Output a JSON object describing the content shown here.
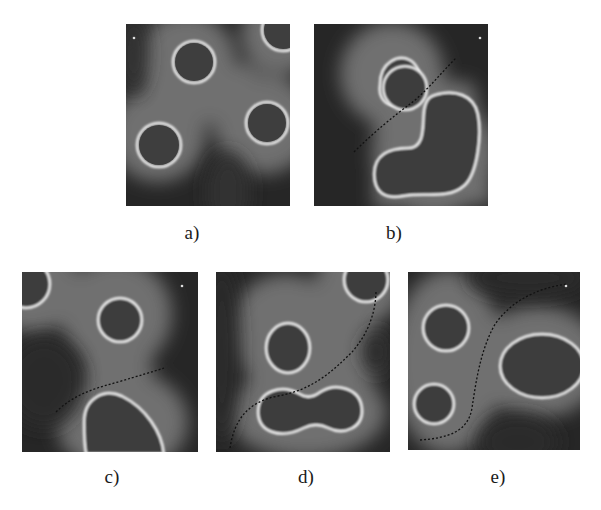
{
  "figure": {
    "panels": [
      {
        "id": "a",
        "label": "a)",
        "has_path": false
      },
      {
        "id": "b",
        "label": "b)",
        "has_path": true
      },
      {
        "id": "c",
        "label": "c)",
        "has_path": true
      },
      {
        "id": "d",
        "label": "d)",
        "has_path": true
      },
      {
        "id": "e",
        "label": "e)",
        "has_path": true
      }
    ],
    "colors": {
      "background": "#2a2a2a",
      "halo": "#6e6e6e",
      "ring": "#f0f0f0",
      "path": "#111111"
    }
  }
}
